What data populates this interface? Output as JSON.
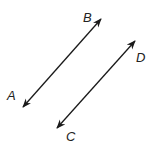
{
  "diagram": {
    "colors": {
      "line": "#1a1a1a",
      "label": "#222222",
      "background": "#ffffff"
    },
    "lines": [
      {
        "name": "line-ab",
        "from": "A",
        "to": "B",
        "x1": 23,
        "y1": 107,
        "x2": 101,
        "y2": 19,
        "arrows": "both"
      },
      {
        "name": "line-cd",
        "from": "C",
        "to": "D",
        "x1": 57,
        "y1": 128,
        "x2": 135,
        "y2": 41,
        "arrows": "both"
      }
    ],
    "labels": [
      {
        "text": "A",
        "x": 7,
        "y": 100
      },
      {
        "text": "B",
        "x": 83,
        "y": 22
      },
      {
        "text": "C",
        "x": 66,
        "y": 141
      },
      {
        "text": "D",
        "x": 136,
        "y": 62
      }
    ]
  }
}
